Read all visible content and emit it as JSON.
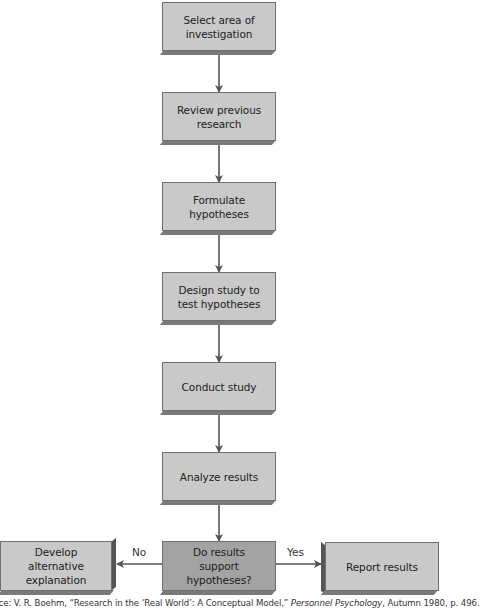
{
  "flowchart": {
    "steps": [
      {
        "id": "step-1",
        "text": "Select area of\ninvestigation"
      },
      {
        "id": "step-2",
        "text": "Review previous\nresearch"
      },
      {
        "id": "step-3",
        "text": "Formulate hypotheses"
      },
      {
        "id": "step-4",
        "text": "Design study to\ntest hypotheses"
      },
      {
        "id": "step-5",
        "text": "Conduct study"
      },
      {
        "id": "step-6",
        "text": "Analyze results"
      }
    ],
    "decision": {
      "text": "Do results\nsupport\nhypotheses?"
    },
    "no_branch": {
      "label": "No",
      "text": "Develop\nalternative\nexplanation"
    },
    "yes_branch": {
      "label": "Yes",
      "text": "Report results"
    }
  },
  "source": {
    "prefix": "urce: V. R. Boehm, “Research in the ‘Real World’: A Conceptual Model,” ",
    "journal": "Personnel Psychology",
    "suffix": ", Autumn 1980, p. 496."
  },
  "colors": {
    "box_fill": "#c9c9c9",
    "decision_fill": "#a3a3a3",
    "box_shadow": "#7a7a7a",
    "arrow": "#555555"
  }
}
